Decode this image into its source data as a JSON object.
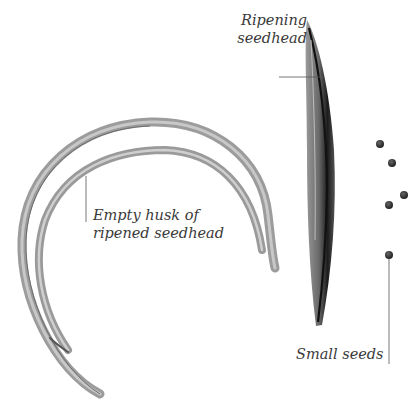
{
  "labels": {
    "ripening_seedhead": [
      "Ripening",
      "seedhead"
    ],
    "empty_husk": [
      "Empty husk of",
      "ripened seedhead"
    ],
    "small_seeds": "Small seeds"
  },
  "colors": {
    "background": "#ffffff",
    "label_text": "#3a3a3a",
    "leader_line": "#555555",
    "husk": "#8a8a8a",
    "seedhead_dark": "#222222",
    "seed": "#2a2a2a"
  },
  "seeds": [
    {
      "x": 380,
      "y": 144
    },
    {
      "x": 392,
      "y": 163
    },
    {
      "x": 404,
      "y": 195
    },
    {
      "x": 389,
      "y": 205
    },
    {
      "x": 389,
      "y": 255
    }
  ]
}
